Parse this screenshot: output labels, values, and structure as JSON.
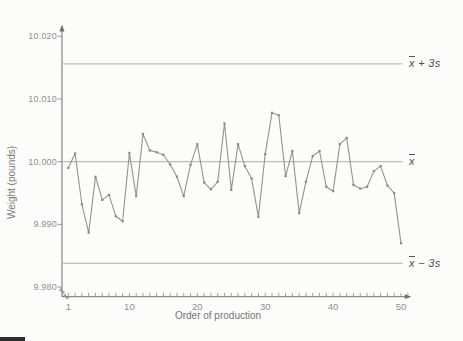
{
  "figure": {
    "background": "#fcfcfb"
  },
  "chart_data": {
    "type": "line",
    "title": "",
    "xlabel": "Order of production",
    "ylabel": "Weight (pounds)",
    "x": [
      1,
      2,
      3,
      4,
      5,
      6,
      7,
      8,
      9,
      10,
      11,
      12,
      13,
      14,
      15,
      16,
      17,
      18,
      19,
      20,
      21,
      22,
      23,
      24,
      25,
      26,
      27,
      28,
      29,
      30,
      31,
      32,
      33,
      34,
      35,
      36,
      37,
      38,
      39,
      40,
      41,
      42,
      43,
      44,
      45,
      46,
      47,
      48,
      49,
      50
    ],
    "values": [
      9.999,
      10.0013,
      9.9932,
      9.9887,
      9.9976,
      9.9939,
      9.9947,
      9.9913,
      9.9905,
      10.0014,
      9.9945,
      10.0044,
      10.0018,
      10.0015,
      10.0011,
      9.9996,
      9.9976,
      9.9945,
      9.9995,
      10.0028,
      9.9967,
      9.9956,
      9.9968,
      10.0061,
      9.9955,
      10.0028,
      9.9993,
      9.9973,
      9.9912,
      10.0012,
      10.0078,
      10.0074,
      9.9977,
      10.0017,
      9.9918,
      9.9968,
      10.0009,
      10.0017,
      9.996,
      9.9953,
      10.0028,
      10.0038,
      9.9963,
      9.9957,
      9.996,
      9.9985,
      9.9993,
      9.9962,
      9.995,
      9.987
    ],
    "xlim": [
      1,
      50
    ],
    "ylim": [
      9.978,
      10.022
    ],
    "grid": false,
    "legend": "none",
    "y_ticks": [
      {
        "value": 10.02,
        "label": "10.020"
      },
      {
        "value": 10.01,
        "label": "10.010"
      },
      {
        "value": 10.0,
        "label": "10.000"
      },
      {
        "value": 9.99,
        "label": "9.990"
      },
      {
        "value": 9.98,
        "label": "9.980"
      }
    ],
    "x_ticks": [
      {
        "value": 1,
        "label": "1"
      },
      {
        "value": 10,
        "label": "10"
      },
      {
        "value": 20,
        "label": "20"
      },
      {
        "value": 30,
        "label": "30"
      },
      {
        "value": 40,
        "label": "40"
      },
      {
        "value": 50,
        "label": "50"
      }
    ],
    "minor_x_ticks_every": 1,
    "reference_lines": [
      {
        "id": "ucl",
        "label": "x̄ + 3s",
        "symbol": "x",
        "suffix": " + 3s",
        "value": 10.0156
      },
      {
        "id": "center",
        "label": "x̄",
        "symbol": "x",
        "suffix": "",
        "value": 10.0
      },
      {
        "id": "lcl",
        "label": "x̄ − 3s",
        "symbol": "x",
        "suffix": " − 3s",
        "value": 9.9838
      }
    ],
    "colors": {
      "data_line": "#95938e",
      "marker": "#8b8984",
      "reference_line": "#aaa49c",
      "axis": "#6f6f6f",
      "tick": "#8b8b8b",
      "tick_label_text": "#8f8f8f",
      "axis_title_text": "#7a7a7a",
      "reference_label_text": "#4f4f4f"
    }
  }
}
